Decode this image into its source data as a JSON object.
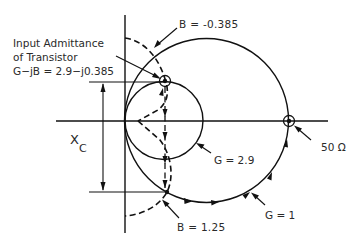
{
  "diagram": {
    "type": "admittance chart (Smith chart) matching diagram",
    "labels": {
      "input_admittance_line1": "Input Admittance",
      "input_admittance_line2": "of Transistor",
      "input_admittance_value": "G−jB = 2.9−j0.385",
      "b_top": "B = -0.385",
      "g_small_circle": "G = 2.9",
      "b_bottom": "B = 1.25",
      "g_big_circle": "G = 1",
      "load": "50 Ω",
      "xc_main": "X",
      "xc_sub": "C"
    },
    "elements": {
      "big_circle": {
        "conductance": 1,
        "center": [
          206.5,
          120.5
        ],
        "radius": 82
      },
      "small_circle": {
        "conductance": 2.9,
        "center": [
          164,
          120.5
        ],
        "radius": 39
      },
      "start_point": {
        "name": "input admittance",
        "position": [
          165,
          81
        ]
      },
      "end_point": {
        "name": "50 ohm",
        "position": [
          289,
          121
        ]
      },
      "intermediate_point": {
        "susceptance": 1.25,
        "position": [
          167,
          192
        ]
      }
    },
    "colors": {
      "ink": "#111111",
      "background": "#ffffff"
    }
  }
}
